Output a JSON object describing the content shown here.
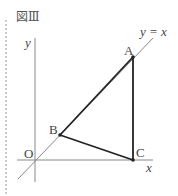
{
  "figure": {
    "title": "図Ⅲ",
    "axes": {
      "x_label": "x",
      "y_label": "y",
      "origin_label": "O"
    },
    "line": {
      "label": "y = x"
    },
    "points": [
      {
        "name": "A",
        "x": 133,
        "y": 57
      },
      {
        "name": "B",
        "x": 60,
        "y": 135
      },
      {
        "name": "C",
        "x": 133,
        "y": 160
      }
    ],
    "colors": {
      "axis": "#888888",
      "triangle": "#222222",
      "border": "#999999"
    }
  }
}
